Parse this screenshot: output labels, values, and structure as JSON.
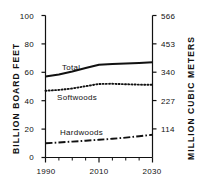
{
  "chart_data": {
    "type": "line",
    "title": "",
    "xlabel": "",
    "ylabel": "BILLION BOARD FEET",
    "ylabel_right": "MILLION CUBIC METERS",
    "x": [
      1990,
      1995,
      2000,
      2005,
      2010,
      2015,
      2020,
      2025,
      2030
    ],
    "xlim": [
      1990,
      2030
    ],
    "ylim": [
      0,
      100
    ],
    "ylim_right": [
      0,
      566
    ],
    "grid": false,
    "legend_position": "inline-annotations",
    "xticks": [
      1990,
      2010,
      2030
    ],
    "xticklabels": [
      "1990",
      "2010",
      "2030"
    ],
    "xminorticks": [
      1995,
      2000,
      2005,
      2015,
      2020,
      2025
    ],
    "yticks": [
      0,
      20,
      40,
      60,
      80,
      100
    ],
    "yticklabels": [
      "0",
      "20",
      "40",
      "60",
      "80",
      "100"
    ],
    "yticks_right": [
      0,
      114,
      227,
      340,
      453,
      566
    ],
    "yticklabels_right": [
      "",
      "114",
      "227",
      "340",
      "453",
      "566"
    ],
    "series": [
      {
        "name": "Total",
        "style": "solid",
        "label_text": "Total",
        "values": [
          57.0,
          58.5,
          60.5,
          63.0,
          65.3,
          65.8,
          66.2,
          66.6,
          67.0
        ]
      },
      {
        "name": "Softwoods",
        "style": "dotted",
        "label_text": "Softwoods",
        "values": [
          47.0,
          47.6,
          48.6,
          50.2,
          51.8,
          51.9,
          51.6,
          51.3,
          51.2
        ]
      },
      {
        "name": "Hardwoods",
        "style": "dash-dot",
        "label_text": "Hardwoods",
        "values": [
          10.0,
          10.6,
          11.2,
          11.8,
          12.5,
          13.2,
          14.0,
          15.0,
          16.0
        ]
      }
    ]
  },
  "axes": {
    "left_title": "BILLION BOARD FEET",
    "right_title": "MILLION CUBIC METERS",
    "left_ticks": [
      "100",
      "80",
      "60",
      "40",
      "20",
      "0"
    ],
    "right_ticks": [
      "566",
      "453",
      "340",
      "227",
      "114"
    ],
    "x_ticks": [
      "1990",
      "2010",
      "2030"
    ]
  },
  "annotations": {
    "total": "Total",
    "softwoods": "Softwoods",
    "hardwoods": "Hardwoods"
  },
  "colors": {
    "ink": "#111111",
    "background": "#ffffff"
  }
}
